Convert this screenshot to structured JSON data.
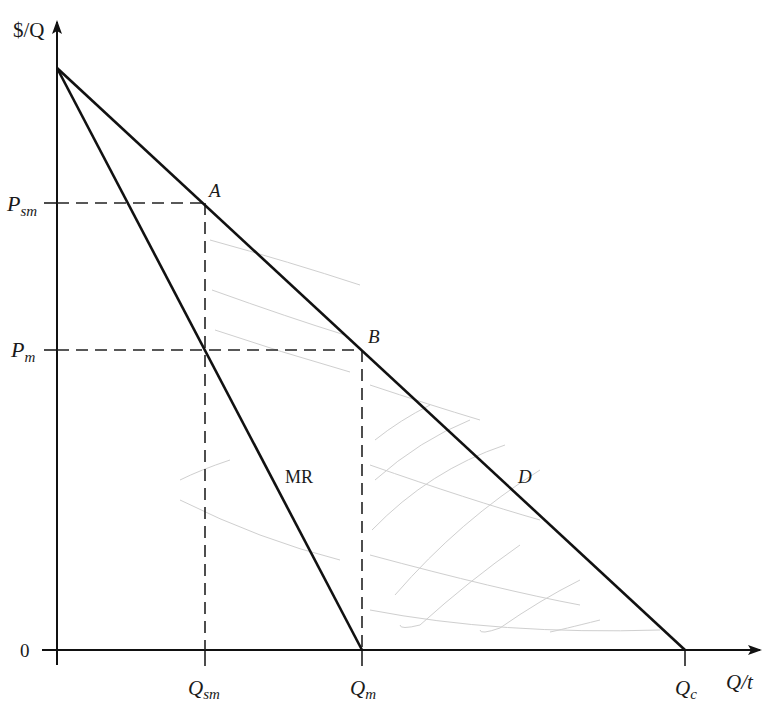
{
  "diagram": {
    "type": "monopoly-deadweight-loss",
    "axes": {
      "y_label": "$/Q",
      "x_label": "Q/t",
      "origin_label": "0"
    },
    "price_ticks": [
      {
        "id": "psm",
        "main": "P",
        "sub": "sm"
      },
      {
        "id": "pm",
        "main": "P",
        "sub": "m"
      }
    ],
    "quantity_ticks": [
      {
        "id": "qsm",
        "main": "Q",
        "sub": "sm"
      },
      {
        "id": "qm",
        "main": "Q",
        "sub": "m"
      },
      {
        "id": "qc",
        "main": "Q",
        "sub": "c"
      }
    ],
    "curves": {
      "demand": "D",
      "marginal_revenue": "MR"
    },
    "points": {
      "a": "A",
      "b": "B"
    },
    "colors": {
      "line": "#111111",
      "dash": "#222222",
      "hatch": "#c8c8c8",
      "background": "#ffffff"
    }
  }
}
